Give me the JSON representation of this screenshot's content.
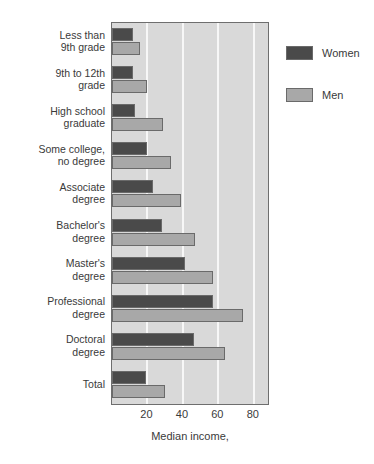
{
  "chart_data": {
    "type": "bar",
    "orientation": "horizontal",
    "title": "",
    "xlabel": "Median income,",
    "ylabel": "",
    "xlim": [
      0,
      88
    ],
    "xticks": [
      20,
      40,
      60,
      80
    ],
    "grid": true,
    "legend_position": "right",
    "categories": [
      "Less than\n9th grade",
      "9th to 12th\ngrade",
      "High school\ngraduate",
      "Some college,\nno degree",
      "Associate\ndegree",
      "Bachelor's\ndegree",
      "Master's\ndegree",
      "Professional\ndegree",
      "Doctoral\ndegree",
      "Total"
    ],
    "category_lines": [
      [
        "Less than",
        "9th grade"
      ],
      [
        "9th to 12th",
        "grade"
      ],
      [
        "High school",
        "graduate"
      ],
      [
        "Some college,",
        "no degree"
      ],
      [
        "Associate",
        "degree"
      ],
      [
        "Bachelor's",
        "degree"
      ],
      [
        "Master's",
        "degree"
      ],
      [
        "Professional",
        "degree"
      ],
      [
        "Doctoral",
        "degree"
      ],
      [
        "Total"
      ]
    ],
    "series": [
      {
        "name": "Women",
        "color": "#4a4a4a",
        "values": [
          12,
          12,
          13,
          20,
          23,
          28,
          41,
          57,
          46,
          19
        ]
      },
      {
        "name": "Men",
        "color": "#a8a8a8",
        "values": [
          16,
          20,
          29,
          33,
          39,
          47,
          57,
          74,
          64,
          30
        ]
      }
    ]
  },
  "legend": {
    "items": [
      {
        "label": "Women",
        "color": "#4a4a4a"
      },
      {
        "label": "Men",
        "color": "#a8a8a8"
      }
    ]
  },
  "axis": {
    "tick_labels": [
      "20",
      "40",
      "60",
      "80"
    ],
    "x_axis_title": "Median income,"
  },
  "colors": {
    "plot_background": "#d9d9d9",
    "gridline": "#f7f7f7",
    "frame": "#6e6e6e",
    "women_bar": "#4a4a4a",
    "men_bar": "#a8a8a8",
    "text": "#3a3a3a"
  }
}
